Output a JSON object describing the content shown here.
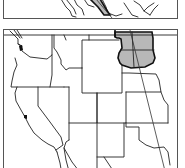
{
  "map": {
    "panels": [
      {
        "id": "top-panel",
        "description": "cropped map inset with shaded region"
      },
      {
        "id": "bottom-panel",
        "description": "outline map of western United States with highlighted region"
      }
    ],
    "highlighted_region": {
      "states": [
        "North Dakota",
        "South Dakota"
      ],
      "fill": "#b8b8b8",
      "outline": "#111111"
    },
    "colors": {
      "background": "#ffffff",
      "state_lines": "#222222",
      "shading": "#b8b8b8"
    },
    "features": [
      "state boundaries",
      "thick outline around highlighted area",
      "diagonal route line crossing highlighted area"
    ]
  }
}
